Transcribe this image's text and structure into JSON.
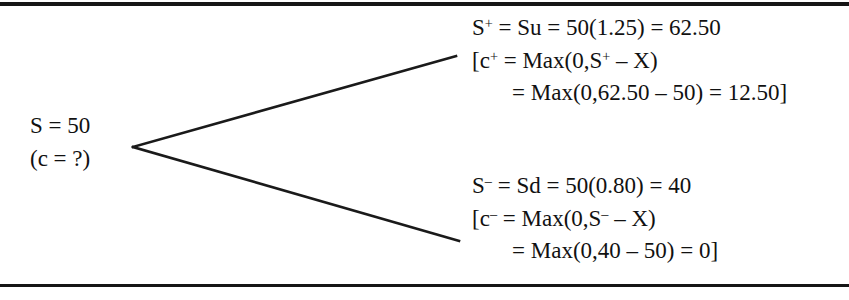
{
  "figure": {
    "background_color": "#ffffff",
    "ink_color": "#161616",
    "rule_top_label": "top-horizontal-rule",
    "rule_bottom_label": "bottom-horizontal-rule"
  },
  "root_node": {
    "lines": [
      "S = 50",
      "(c = ?)"
    ]
  },
  "outcome_up": {
    "lines": [
      {
        "prefix": "S",
        "sup": "+",
        "rest": " = Su = 50(1.25) = 62.50",
        "indent": false
      },
      {
        "prefix": "[c",
        "sup": "+",
        "rest": " = Max(0,S",
        "sup2": "+",
        "rest2": " – X)",
        "indent": false
      },
      {
        "prefix": "",
        "sup": "",
        "rest": "= Max(0,62.50 – 50) = 12.50]",
        "indent": true
      }
    ],
    "plain_text": [
      "S+ = Su = 50(1.25) = 62.50",
      "[c+ = Max(0,S+ – X)",
      "= Max(0,62.50 – 50) = 12.50]"
    ]
  },
  "outcome_down": {
    "lines": [
      {
        "prefix": "S",
        "sup": "–",
        "rest": " = Sd = 50(0.80) = 40",
        "indent": false
      },
      {
        "prefix": "[c",
        "sup": "–",
        "rest": " = Max(0,S",
        "sup2": "–",
        "rest2": " – X)",
        "indent": false
      },
      {
        "prefix": "",
        "sup": "",
        "rest": "= Max(0,40 – 50) = 0]",
        "indent": true
      }
    ],
    "plain_text": [
      "S– = Sd = 50(0.80) = 40",
      "[c– = Max(0,S– – X)",
      "= Max(0,40 – 50) = 0]"
    ]
  },
  "tree_geometry": {
    "vertex": {
      "x": 133,
      "y": 147
    },
    "up_endpoint": {
      "x": 456,
      "y": 56
    },
    "down_endpoint": {
      "x": 459,
      "y": 241
    }
  }
}
